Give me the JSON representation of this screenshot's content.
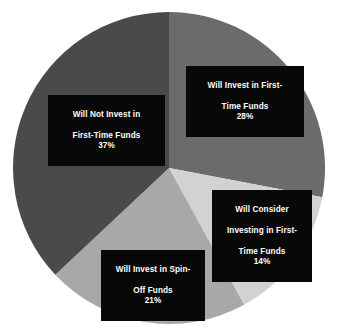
{
  "chart_data": {
    "type": "pie",
    "title": "",
    "subtitle": "",
    "xlabel": "",
    "ylabel": "",
    "legend_position": "none",
    "grid": false,
    "start_angle_deg": 0,
    "direction": "clockwise",
    "categories": [
      "Will Invest in First-Time Funds",
      "Will Consider Investing in First-Time Funds",
      "Will Invest in Spin-Off Funds",
      "Will Not Invest in First-Time Funds"
    ],
    "values": [
      28,
      14,
      21,
      37
    ],
    "value_labels": [
      "28%",
      "14%",
      "21%",
      "37%"
    ],
    "units": "percent",
    "colors": [
      "#6b6b6b",
      "#d2d2d2",
      "#a8a8a8",
      "#4a4a4a"
    ],
    "slices": [
      {
        "name": "Will Invest in First-Time Funds",
        "label_line_1": "Will Invest in First-",
        "label_line_2": "Time Funds",
        "label_line_3": "",
        "value": 28,
        "value_label": "28%",
        "color": "#6b6b6b",
        "start_deg": 0,
        "end_deg": 100.8
      },
      {
        "name": "Will Consider Investing in First-Time Funds",
        "label_line_1": "Will Consider",
        "label_line_2": "Investing in First-",
        "label_line_3": "Time Funds",
        "value": 14,
        "value_label": "14%",
        "color": "#d2d2d2",
        "start_deg": 100.8,
        "end_deg": 151.2
      },
      {
        "name": "Will Invest in Spin-Off Funds",
        "label_line_1": "Will Invest in Spin-",
        "label_line_2": "Off Funds",
        "label_line_3": "",
        "value": 21,
        "value_label": "21%",
        "color": "#a8a8a8",
        "start_deg": 151.2,
        "end_deg": 226.8
      },
      {
        "name": "Will Not Invest in First-Time Funds",
        "label_line_1": "Will Not Invest in",
        "label_line_2": "First-Time Funds",
        "label_line_3": "",
        "value": 37,
        "value_label": "37%",
        "color": "#4a4a4a",
        "start_deg": 226.8,
        "end_deg": 360
      }
    ],
    "background_color": "#ffffff",
    "label_box_color": "#080808",
    "label_text_color": "#ffffff"
  },
  "geometry": {
    "center_x": 169,
    "center_y": 168,
    "radius": 156
  }
}
